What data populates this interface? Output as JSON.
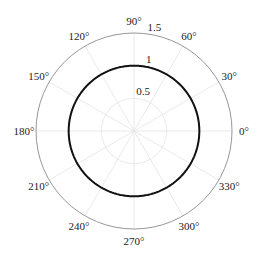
{
  "chart_data": {
    "type": "line",
    "projection": "polar",
    "title": "",
    "theta_ticks": [
      0,
      30,
      60,
      90,
      120,
      150,
      180,
      210,
      240,
      270,
      300,
      330
    ],
    "theta_tick_labels": [
      "0°",
      "30°",
      "60°",
      "90°",
      "120°",
      "150°",
      "180°",
      "210°",
      "240°",
      "270°",
      "300°",
      "330°"
    ],
    "r_ticks": [
      0.5,
      1,
      1.5
    ],
    "r_tick_labels": [
      "0.5",
      "1",
      "1.5"
    ],
    "rlim": [
      0,
      1.5
    ],
    "grid": true,
    "series": [
      {
        "name": "r = 1",
        "theta_deg": [
          0,
          30,
          60,
          90,
          120,
          150,
          180,
          210,
          240,
          270,
          300,
          330,
          360
        ],
        "r": [
          1,
          1,
          1,
          1,
          1,
          1,
          1,
          1,
          1,
          1,
          1,
          1,
          1
        ],
        "color": "#111111"
      }
    ]
  }
}
